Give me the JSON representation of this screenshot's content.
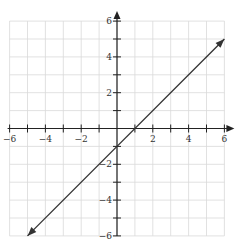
{
  "chart_data": {
    "type": "line",
    "title": "",
    "xlabel": "",
    "ylabel": "",
    "xlim": [
      -6,
      6
    ],
    "ylim": [
      -6,
      6
    ],
    "grid": true,
    "grid_step": 1,
    "x_tick_labels": [
      "-6",
      "-4",
      "-2",
      "2",
      "4",
      "6"
    ],
    "x_tick_values": [
      -6,
      -4,
      -2,
      2,
      4,
      6
    ],
    "y_tick_labels": [
      "6",
      "4",
      "2",
      "-2",
      "-4",
      "-6"
    ],
    "y_tick_values": [
      6,
      4,
      2,
      -2,
      -4,
      -6
    ],
    "series": [
      {
        "name": "y = x - 1",
        "equation": "y = x - 1",
        "x": [
          -5,
          6
        ],
        "y": [
          -6,
          5
        ],
        "arrows_both_ends": true,
        "intercepts": {
          "x": [
            1,
            0
          ],
          "y": [
            0,
            -1
          ]
        }
      }
    ],
    "axis_arrows": {
      "x_positive": true,
      "y_positive": true
    },
    "legend": null
  },
  "colors": {
    "grid": "#d9d9d9",
    "axis": "#222222",
    "line": "#333333",
    "text": "#333333"
  },
  "layout": {
    "origin_px": [
      117,
      128.5
    ],
    "unit_px": 17.9
  }
}
